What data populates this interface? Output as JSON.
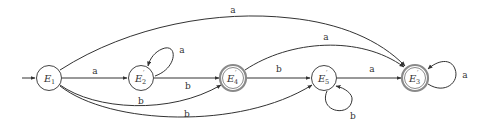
{
  "diagram": {
    "type": "finite-automaton",
    "start_state": "E1",
    "states": [
      {
        "id": "E1",
        "name": "E",
        "sub": "1",
        "prime": "",
        "accepting": false
      },
      {
        "id": "E2p",
        "name": "E",
        "sub": "2",
        "prime": "′",
        "accepting": false
      },
      {
        "id": "E4p",
        "name": "E",
        "sub": "4",
        "prime": "′",
        "accepting": true
      },
      {
        "id": "E5p",
        "name": "E",
        "sub": "5",
        "prime": "′",
        "accepting": false
      },
      {
        "id": "E3p",
        "name": "E",
        "sub": "3",
        "prime": "′",
        "accepting": true
      }
    ],
    "transitions": [
      {
        "from": "E1",
        "to": "E2p",
        "label": "a"
      },
      {
        "from": "E1",
        "to": "E3p",
        "label": "a"
      },
      {
        "from": "E1",
        "to": "E4p",
        "label": "b"
      },
      {
        "from": "E1",
        "to": "E5p",
        "label": "b"
      },
      {
        "from": "E2p",
        "to": "E2p",
        "label": "a"
      },
      {
        "from": "E2p",
        "to": "E4p",
        "label": "b"
      },
      {
        "from": "E4p",
        "to": "E3p",
        "label": "a"
      },
      {
        "from": "E4p",
        "to": "E5p",
        "label": "b"
      },
      {
        "from": "E5p",
        "to": "E5p",
        "label": "b"
      },
      {
        "from": "E5p",
        "to": "E3p",
        "label": "a"
      },
      {
        "from": "E3p",
        "to": "E3p",
        "label": "a"
      }
    ]
  }
}
